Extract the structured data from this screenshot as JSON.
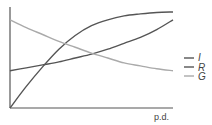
{
  "chart_data": {
    "type": "line",
    "title": "",
    "xlabel": "p.d.",
    "ylabel": "",
    "grid": false,
    "legend_position": "right",
    "x": [
      0,
      0.1,
      0.2,
      0.3,
      0.4,
      0.5,
      0.6,
      0.7,
      0.8,
      0.9,
      1.0
    ],
    "series": [
      {
        "name": "I",
        "color": "#555555",
        "values": [
          0,
          0.22,
          0.42,
          0.6,
          0.74,
          0.84,
          0.9,
          0.94,
          0.96,
          0.975,
          0.98
        ]
      },
      {
        "name": "R",
        "color": "#555555",
        "values": [
          0.38,
          0.41,
          0.44,
          0.47,
          0.51,
          0.55,
          0.6,
          0.66,
          0.72,
          0.8,
          0.9
        ]
      },
      {
        "name": "G",
        "color": "#aaaaaa",
        "values": [
          0.9,
          0.82,
          0.75,
          0.68,
          0.62,
          0.56,
          0.51,
          0.46,
          0.43,
          0.4,
          0.38
        ]
      }
    ],
    "axis_ranges": {
      "x": [
        0,
        1
      ],
      "y": [
        0,
        1
      ]
    }
  },
  "legend": {
    "items": [
      {
        "label": "I",
        "color": "#555555"
      },
      {
        "label": "R",
        "color": "#555555"
      },
      {
        "label": "G",
        "color": "#aaaaaa"
      }
    ]
  },
  "axes": {
    "xlabel": "p.d."
  }
}
